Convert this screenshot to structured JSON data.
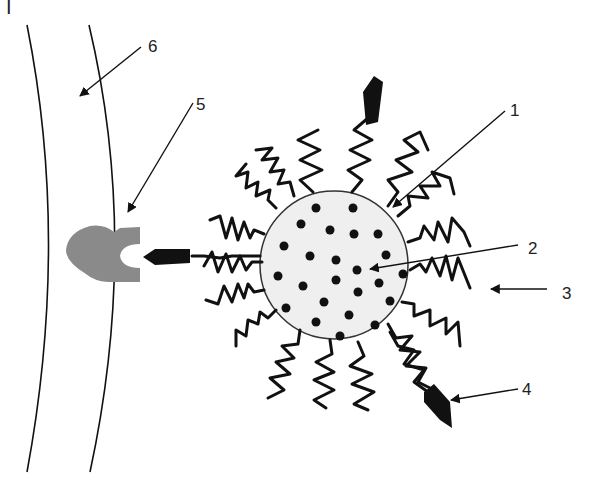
{
  "figure": {
    "panel_label": "I",
    "colors": {
      "stroke": "#111111",
      "core_fill": "#efefef",
      "receptor_fill": "#8a8a8a",
      "background": "#ffffff"
    },
    "labels": [
      {
        "id": "1",
        "text": "1",
        "points_to": "particle-surface"
      },
      {
        "id": "2",
        "text": "2",
        "points_to": "encapsulated-drug-dot"
      },
      {
        "id": "3",
        "text": "3",
        "points_to": "polymer-chain"
      },
      {
        "id": "4",
        "text": "4",
        "points_to": "targeting-ligand"
      },
      {
        "id": "5",
        "text": "5",
        "points_to": "cell-membrane-receptor"
      },
      {
        "id": "6",
        "text": "6",
        "points_to": "cell-membrane"
      }
    ]
  }
}
